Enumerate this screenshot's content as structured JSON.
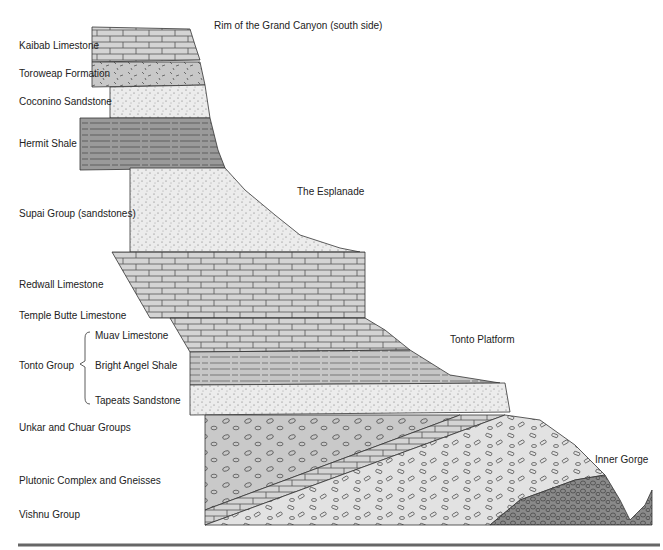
{
  "title": "Rim of the Grand Canyon (south side)",
  "features": {
    "esplanade": "The Esplanade",
    "tonto_platform": "Tonto Platform",
    "inner_gorge": "Inner Gorge"
  },
  "layers": [
    {
      "name": "Kaibab Limestone",
      "pattern": "brick"
    },
    {
      "name": "Toroweap Formation",
      "pattern": "dashes"
    },
    {
      "name": "Coconino Sandstone",
      "pattern": "dots"
    },
    {
      "name": "Hermit Shale",
      "pattern": "lines"
    },
    {
      "name": "Supai Group (sandstones)",
      "pattern": "dots"
    },
    {
      "name": "Redwall Limestone",
      "pattern": "brick"
    },
    {
      "name": "Temple Butte Limestone",
      "pattern": "brick"
    },
    {
      "name": "Muav Limestone",
      "pattern": "brick"
    },
    {
      "name": "Bright Angel Shale",
      "pattern": "lines"
    },
    {
      "name": "Tapeats Sandstone",
      "pattern": "dots"
    },
    {
      "name": "Unkar and Chuar Groups",
      "pattern": "tilted-strata"
    },
    {
      "name": "Plutonic Complex and Gneisses",
      "pattern": "pebbles"
    },
    {
      "name": "Vishnu Group",
      "pattern": "dense-pebbles"
    }
  ],
  "group": {
    "name": "Tonto Group"
  }
}
